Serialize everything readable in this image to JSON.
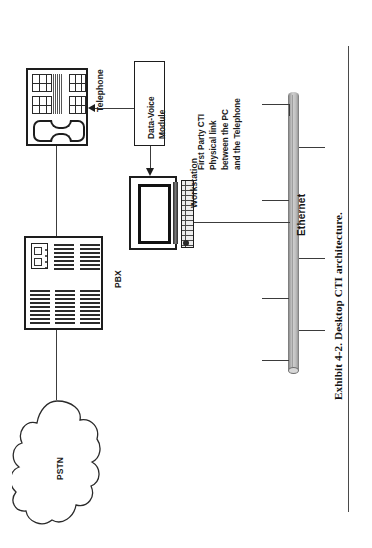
{
  "figure": {
    "caption": "Exhibit 4-2.  Desktop CTI architecture.",
    "orientation": "rotated-90"
  },
  "nodes": {
    "pstn": {
      "label": "PSTN",
      "shape": "cloud-icon"
    },
    "pbx": {
      "label": "PBX",
      "shape": "pbx-cabinet-icon"
    },
    "telephone": {
      "label": "Telephone",
      "shape": "desk-phone-icon"
    },
    "workstation": {
      "label": "Workstation",
      "shape": "monitor-keyboard-icon"
    },
    "data_voice_module": {
      "label": "Data-Voice\nModule",
      "label_line1": "Data-Voice",
      "label_line2": "Module",
      "shape": "rect-box"
    },
    "ethernet": {
      "label": "Ethernet",
      "shape": "bus-cylinder"
    }
  },
  "annotations": {
    "first_party_cti": {
      "line1": "First Party CTI",
      "line2": "Physical link",
      "line3": "between the PC",
      "line4": "and the Telephone"
    }
  },
  "colors": {
    "ink": "#1c1c1c",
    "line": "#3c3c3c",
    "bus_fill": "#bdbdbd",
    "paper": "#ffffff"
  }
}
